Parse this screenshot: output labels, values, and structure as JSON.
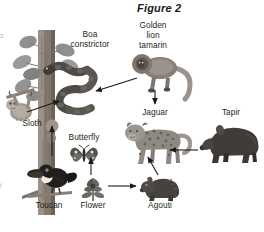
{
  "figure": {
    "title": "Figure 2"
  },
  "labels": {
    "boa_constrictor": "Boa\nconstrictor",
    "golden_lion_tamarin": "Golden\nlion\ntamarin",
    "jaguar": "Jaguar",
    "tapir": "Tapir",
    "sloth": "Sloth",
    "butterfly": "Butterfly",
    "toucan": "Toucan",
    "flower": "Flower",
    "agouti": "Agouti"
  },
  "organisms": [
    {
      "id": "boa-constrictor",
      "label": "Boa constrictor"
    },
    {
      "id": "golden-lion-tamarin",
      "label": "Golden lion tamarin"
    },
    {
      "id": "jaguar",
      "label": "Jaguar"
    },
    {
      "id": "tapir",
      "label": "Tapir"
    },
    {
      "id": "sloth",
      "label": "Sloth"
    },
    {
      "id": "butterfly",
      "label": "Butterfly"
    },
    {
      "id": "toucan",
      "label": "Toucan"
    },
    {
      "id": "flower",
      "label": "Flower"
    },
    {
      "id": "agouti",
      "label": "Agouti"
    }
  ],
  "food_web_arrows": [
    {
      "from": "golden-lion-tamarin",
      "to": "boa-constrictor"
    },
    {
      "from": "golden-lion-tamarin",
      "to": "jaguar"
    },
    {
      "from": "sloth",
      "to": "boa-constrictor"
    },
    {
      "from": "toucan",
      "to": "boa-constrictor"
    },
    {
      "from": "flower",
      "to": "butterfly"
    },
    {
      "from": "flower",
      "to": "agouti"
    },
    {
      "from": "agouti",
      "to": "jaguar"
    },
    {
      "from": "tapir",
      "to": "jaguar"
    }
  ],
  "colors": {
    "text": "#231f20",
    "arrow": "#1a1a1a",
    "trunk_dark": "#6b6259",
    "trunk_light": "#9c9086",
    "foliage": "#8f8f8f",
    "animal_dark": "#4a4a4a",
    "animal_mid": "#7d7d7d",
    "animal_light": "#b4b4b4",
    "background": "#ffffff"
  },
  "edge_fragments": {
    "top_left": "s",
    "bottom_left": "t"
  }
}
